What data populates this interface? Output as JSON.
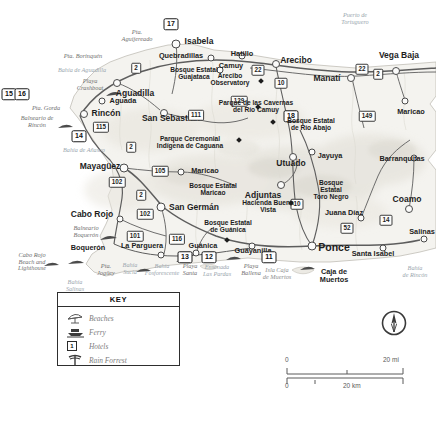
{
  "map": {
    "title": "Western Puerto Rico tourist map",
    "colors": {
      "land": "#f4f3ef",
      "water": "#ffffff",
      "relief": "#e3e1da",
      "road": "#5d5d5d",
      "text": "#1d1d1d",
      "muted": "#9aa6ae"
    }
  },
  "towns": [
    {
      "name": "Isabela",
      "x": 176,
      "y": 44,
      "size": 7,
      "cls": "city",
      "lx": 199,
      "ly": 41
    },
    {
      "name": "Quebradillas",
      "x": 211,
      "y": 58,
      "size": 5,
      "cls": "city sm",
      "lx": 181,
      "ly": 56
    },
    {
      "name": "Camuy",
      "x": 220,
      "y": 70,
      "size": 5,
      "cls": "city sm",
      "lx": 231,
      "ly": 66
    },
    {
      "name": "Hatillo",
      "x": 242,
      "y": 56,
      "size": 5,
      "cls": "city sm",
      "lx": 242,
      "ly": 54
    },
    {
      "name": "Arecibo",
      "x": 276,
      "y": 64,
      "size": 6,
      "cls": "city",
      "lx": 296,
      "ly": 60
    },
    {
      "name": "Manatí",
      "x": 351,
      "y": 78,
      "size": 6,
      "cls": "city",
      "lx": 327,
      "ly": 78
    },
    {
      "name": "Vega Baja",
      "x": 396,
      "y": 71,
      "size": 6,
      "cls": "city",
      "lx": 399,
      "ly": 55
    },
    {
      "name": "Aguadilla",
      "x": 117,
      "y": 83,
      "size": 6,
      "cls": "city",
      "lx": 135,
      "ly": 93
    },
    {
      "name": "Aguada",
      "x": 102,
      "y": 101,
      "size": 5,
      "cls": "city sm",
      "lx": 123,
      "ly": 101
    },
    {
      "name": "Rincón",
      "x": 84,
      "y": 114,
      "size": 6,
      "cls": "city",
      "lx": 106,
      "ly": 113
    },
    {
      "name": "San Sebastián",
      "x": 164,
      "y": 113,
      "size": 6,
      "cls": "city",
      "lx": 171,
      "ly": 118
    },
    {
      "name": "Utuado",
      "x": 293,
      "y": 157,
      "size": 6,
      "cls": "city",
      "lx": 291,
      "ly": 163
    },
    {
      "name": "Jayuya",
      "x": 312,
      "y": 152,
      "size": 5,
      "cls": "city sm",
      "lx": 330,
      "ly": 156
    },
    {
      "name": "Mayagüez",
      "x": 124,
      "y": 168,
      "size": 7,
      "cls": "city",
      "lx": 100,
      "ly": 166
    },
    {
      "name": "Maricao",
      "x": 181,
      "y": 172,
      "size": 5,
      "cls": "city sm",
      "lx": 205,
      "ly": 171
    },
    {
      "name": "Maricao",
      "x": 405,
      "y": 101,
      "size": 5,
      "cls": "city sm",
      "lx": 411,
      "ly": 112
    },
    {
      "name": "Adjuntas",
      "x": 281,
      "y": 185,
      "size": 6,
      "cls": "city",
      "lx": 263,
      "ly": 195
    },
    {
      "name": "Barranquitas",
      "x": 414,
      "y": 158,
      "size": 5,
      "cls": "city sm",
      "lx": 402,
      "ly": 159
    },
    {
      "name": "Coamo",
      "x": 409,
      "y": 209,
      "size": 6,
      "cls": "city",
      "lx": 407,
      "ly": 199
    },
    {
      "name": "San Germán",
      "x": 161,
      "y": 207,
      "size": 7,
      "cls": "city",
      "lx": 194,
      "ly": 207
    },
    {
      "name": "Cabo Rojo",
      "x": 120,
      "y": 219,
      "size": 5,
      "cls": "city",
      "lx": 92,
      "ly": 214
    },
    {
      "name": "Juana Díaz",
      "x": 361,
      "y": 218,
      "size": 5,
      "cls": "city sm",
      "lx": 344,
      "ly": 213
    },
    {
      "name": "La Parguera",
      "x": 161,
      "y": 255,
      "size": 5,
      "cls": "city sm",
      "lx": 142,
      "ly": 246
    },
    {
      "name": "Guánica",
      "x": 196,
      "y": 253,
      "size": 5,
      "cls": "city sm",
      "lx": 203,
      "ly": 246
    },
    {
      "name": "Guayanilla",
      "x": 252,
      "y": 246,
      "size": 5,
      "cls": "city sm",
      "lx": 253,
      "ly": 251
    },
    {
      "name": "Ponce",
      "x": 312,
      "y": 246,
      "size": 7,
      "cls": "city big",
      "lx": 334,
      "ly": 248
    },
    {
      "name": "Santa Isabel",
      "x": 383,
      "y": 248,
      "size": 5,
      "cls": "city sm",
      "lx": 373,
      "ly": 254
    },
    {
      "name": "Salinas",
      "x": 424,
      "y": 239,
      "size": 5,
      "cls": "city sm",
      "lx": 422,
      "ly": 232
    },
    {
      "name": "Boquerón",
      "x": 100,
      "y": 247,
      "size": 0,
      "cls": "city sm",
      "lx": 88,
      "ly": 248
    }
  ],
  "shields": [
    {
      "label": "2",
      "x": 136,
      "y": 68
    },
    {
      "label": "111",
      "x": 196,
      "y": 115
    },
    {
      "label": "22",
      "x": 258,
      "y": 70
    },
    {
      "label": "10",
      "x": 281,
      "y": 83
    },
    {
      "label": "129",
      "x": 239,
      "y": 101
    },
    {
      "label": "22",
      "x": 362,
      "y": 69
    },
    {
      "label": "2",
      "x": 378,
      "y": 74
    },
    {
      "label": "149",
      "x": 367,
      "y": 116
    },
    {
      "label": "115",
      "x": 101,
      "y": 127
    },
    {
      "label": "2",
      "x": 131,
      "y": 147
    },
    {
      "label": "105",
      "x": 160,
      "y": 171
    },
    {
      "label": "102",
      "x": 117,
      "y": 182
    },
    {
      "label": "2",
      "x": 141,
      "y": 195
    },
    {
      "label": "102",
      "x": 145,
      "y": 214
    },
    {
      "label": "101",
      "x": 135,
      "y": 236
    },
    {
      "label": "116",
      "x": 177,
      "y": 239
    },
    {
      "label": "10",
      "x": 297,
      "y": 204
    },
    {
      "label": "52",
      "x": 347,
      "y": 228
    },
    {
      "label": "14",
      "x": 386,
      "y": 220
    }
  ],
  "badges": [
    {
      "label": "17",
      "x": 171,
      "y": 24
    },
    {
      "label": "15",
      "x": 9,
      "y": 94
    },
    {
      "label": "16",
      "x": 22,
      "y": 94
    },
    {
      "label": "14",
      "x": 79,
      "y": 136
    },
    {
      "label": "18",
      "x": 291,
      "y": 116
    },
    {
      "label": "13",
      "x": 185,
      "y": 257
    },
    {
      "label": "12",
      "x": 209,
      "y": 257
    },
    {
      "label": "11",
      "x": 269,
      "y": 257
    }
  ],
  "parks": [
    {
      "name": "Arecibo\nObservatory",
      "x": 230,
      "y": 80,
      "dx": 261,
      "dy": 81
    },
    {
      "name": "Parque de las Cavernas\ndel Río Camuy",
      "x": 256,
      "y": 107,
      "dx": 258,
      "dy": 107
    },
    {
      "name": "Parque Ceremonial\nIndígena de Caguana",
      "x": 190,
      "y": 143,
      "dx": 239,
      "dy": 140
    },
    {
      "name": "Bosque Estatal\nde Río Abajo",
      "x": 311,
      "y": 125,
      "dx": 273,
      "dy": 122
    },
    {
      "name": "Bosque Estatal\nGuajataca",
      "x": 194,
      "y": 74,
      "dx": -1,
      "dy": -1
    },
    {
      "name": "Bosque Estatal\nMaricao",
      "x": 213,
      "y": 190,
      "dx": -1,
      "dy": -1
    },
    {
      "name": "Bosque\nEstatal\nToro Negro",
      "x": 331,
      "y": 190,
      "dx": -1,
      "dy": -1
    },
    {
      "name": "Bosque Estatal\nde Guánica",
      "x": 228,
      "y": 227,
      "dx": 227,
      "dy": 240
    },
    {
      "name": "Hacienda Buena\nVista",
      "x": 268,
      "y": 207,
      "dx": 291,
      "dy": 203
    }
  ],
  "water_labels": [
    {
      "name": "Pta.\nAguijereado",
      "x": 137,
      "y": 36
    },
    {
      "name": "Pta. Borinquén",
      "x": 83,
      "y": 56
    },
    {
      "name": "Bahía de Aguadilla",
      "x": 82,
      "y": 70
    },
    {
      "name": "Playa\nCrashboat",
      "x": 90,
      "y": 85
    },
    {
      "name": "Pta. Gorda",
      "x": 46,
      "y": 108
    },
    {
      "name": "Balneario de\nRincón",
      "x": 37,
      "y": 122
    },
    {
      "name": "Bahía de Añasco",
      "x": 84,
      "y": 150
    },
    {
      "name": "Puerto de\nTortuguero",
      "x": 355,
      "y": 18
    },
    {
      "name": "Balneario\nBoquerón",
      "x": 86,
      "y": 232
    },
    {
      "name": "Cabo Rojo\nBeach and\nLighthouse",
      "x": 32,
      "y": 262
    },
    {
      "name": "Pta.\nJogüey",
      "x": 106,
      "y": 270
    },
    {
      "name": "Bahía\nSucia",
      "x": 130,
      "y": 268
    },
    {
      "name": "Bahía\nFosforescente",
      "x": 162,
      "y": 269
    },
    {
      "name": "Playa\nSanta",
      "x": 190,
      "y": 270
    },
    {
      "name": "Ensenada\nLas Pardas",
      "x": 217,
      "y": 270
    },
    {
      "name": "Playa\nBallena",
      "x": 251,
      "y": 270
    },
    {
      "name": "Bahía\nde Rincón",
      "x": 415,
      "y": 271
    },
    {
      "name": "Bahía\nSalinas",
      "x": 75,
      "y": 285
    },
    {
      "name": "Vega\nBaja",
      "x": -1,
      "y": -1
    }
  ],
  "islands": [
    {
      "name": "Isla Caja\nde Muertos",
      "x": 277,
      "y": 274
    },
    {
      "name": "Caja de\nMuertos",
      "x": 334,
      "y": 276
    }
  ],
  "legend": {
    "title": "KEY",
    "items": [
      {
        "icon": "beach-umbrella-icon",
        "label": "Beaches"
      },
      {
        "icon": "ferry-icon",
        "label": "Ferry"
      },
      {
        "icon": "hotel-icon",
        "label": "Hotels"
      },
      {
        "icon": "rain-forest-icon",
        "label": "Rain Forrest"
      }
    ],
    "hotel_glyph": "1"
  },
  "scale": {
    "mi_start": "0",
    "mi_end": "20 mi",
    "km_start": "0",
    "km_end": "20 km"
  },
  "compass": {
    "label": "compass-rose"
  }
}
